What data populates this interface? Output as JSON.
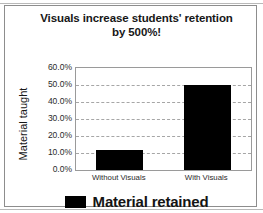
{
  "figure": {
    "title_lines": [
      "Visuals increase students' retention",
      "by 500%!"
    ],
    "border_color": "#8d8d8d",
    "background": "#ffffff"
  },
  "legend": {
    "position": "bottom-center",
    "swatch_color": "#000000",
    "label": "Material retained"
  },
  "chart_data": {
    "type": "bar",
    "title": "Visuals increase students' retention by 500%!",
    "categories": [
      "Without Visuals",
      "With Visuals"
    ],
    "values": [
      12.0,
      50.0
    ],
    "series": [
      {
        "name": "Material retained",
        "values": [
          12.0,
          50.0
        ],
        "color": "#000000"
      }
    ],
    "xlabel": "",
    "ylabel": "Material taught",
    "ylim": [
      0,
      60
    ],
    "ytick_values": [
      0,
      10,
      20,
      30,
      40,
      50,
      60
    ],
    "ytick_labels": [
      "0.0%",
      "10.0%",
      "20.0%",
      "30.0%",
      "40.0%",
      "50.0%",
      "60.0%"
    ],
    "grid": true,
    "grid_style": "dashed",
    "grid_color": "#a6a6a6",
    "legend_position": "bottom",
    "plot_border_color": "#9a9a9a",
    "value_unit": "percent"
  }
}
